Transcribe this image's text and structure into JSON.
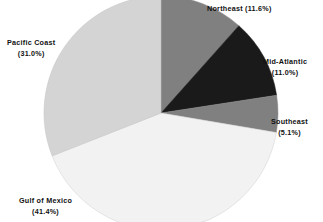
{
  "chart_data": {
    "type": "pie",
    "title": "",
    "subtitle": "",
    "xlabel": "",
    "ylabel": "",
    "legend_position": "none",
    "grid": false,
    "label_format": "name (value%)",
    "start_angle_deg": 0,
    "direction": "clockwise",
    "categories": [
      "Northeast",
      "Mid-Atlantic",
      "Southeast",
      "Gulf of Mexico",
      "Pacific Coast"
    ],
    "values": [
      11.6,
      11.0,
      5.1,
      41.4,
      31.0
    ],
    "units": "percent",
    "slices": [
      {
        "name": "Northeast",
        "value": 11.6,
        "value_text": "11.6%",
        "label_text": "Northeast (11.6%)",
        "color": "#808080"
      },
      {
        "name": "Mid-Atlantic",
        "value": 11.0,
        "value_text": "11.0%",
        "label_name": "Mid-Atlantic",
        "label_pct": "(11.0%)",
        "color": "#1a1a1a"
      },
      {
        "name": "Southeast",
        "value": 5.1,
        "value_text": "5.1%",
        "label_name": "Southeast",
        "label_pct": "(5.1%)",
        "color": "#808080"
      },
      {
        "name": "Gulf of Mexico",
        "value": 41.4,
        "value_text": "41.4%",
        "label_name": "Gulf of Mexico",
        "label_pct": "(41.4%)",
        "color": "#f2f2f2"
      },
      {
        "name": "Pacific Coast",
        "value": 31.0,
        "value_text": "31.0%",
        "label_name": "Pacific Coast",
        "label_pct": "(31.0%)",
        "color": "#d4d4d4"
      }
    ]
  },
  "labels": {
    "northeast": {
      "name": "Northeast",
      "pct": "(11.6%)"
    },
    "mid_atlantic": {
      "name": "Mid-Atlantic",
      "pct": "(11.0%)"
    },
    "southeast": {
      "name": "Southeast",
      "pct": "(5.1%)"
    },
    "gulf_of_mexico": {
      "name": "Gulf of Mexico",
      "pct": "(41.4%)"
    },
    "pacific_coast": {
      "name": "Pacific Coast",
      "pct": "(31.0%)"
    }
  },
  "colors": {
    "northeast": "#808080",
    "mid_atlantic": "#1a1a1a",
    "southeast": "#808080",
    "gulf_of_mexico": "#f2f2f2",
    "pacific_coast": "#d4d4d4",
    "outline": "#9a9a9a",
    "text": "#111111",
    "background": "#ffffff"
  }
}
